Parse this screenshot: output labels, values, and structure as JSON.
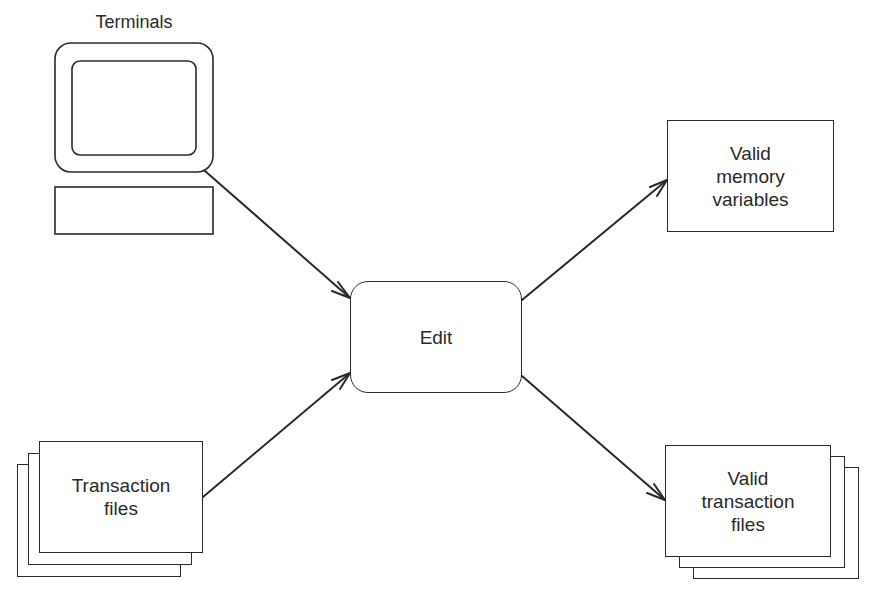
{
  "diagram": {
    "type": "data-flow",
    "nodes": {
      "terminals": {
        "label": "Terminals",
        "shape": "terminal-icon"
      },
      "transaction_files": {
        "label": "Transaction\nfiles",
        "shape": "stacked-documents"
      },
      "edit": {
        "label": "Edit",
        "shape": "rounded-rectangle"
      },
      "valid_memory_variables": {
        "label": "Valid\nmemory\nvariables",
        "shape": "rectangle"
      },
      "valid_transaction_files": {
        "label": "Valid\ntransaction\nfiles",
        "shape": "stacked-documents"
      }
    },
    "edges": [
      {
        "from": "terminals",
        "to": "edit"
      },
      {
        "from": "transaction_files",
        "to": "edit"
      },
      {
        "from": "edit",
        "to": "valid_memory_variables"
      },
      {
        "from": "edit",
        "to": "valid_transaction_files"
      }
    ],
    "colors": {
      "stroke": "#2a2a2a",
      "background": "#ffffff"
    }
  }
}
